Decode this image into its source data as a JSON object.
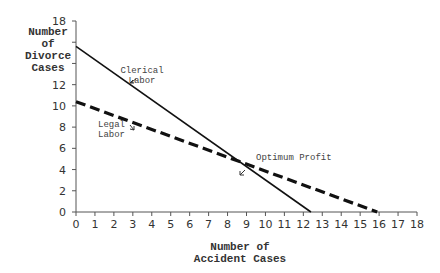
{
  "chart_data": {
    "type": "line",
    "title": "",
    "xlabel": "Number of Accident Cases",
    "ylabel": "Number of Divorce Cases",
    "xlim": [
      0,
      18
    ],
    "ylim": [
      0,
      18
    ],
    "x_ticks": [
      0,
      1,
      2,
      3,
      4,
      5,
      6,
      7,
      8,
      9,
      10,
      11,
      12,
      13,
      14,
      15,
      16,
      17,
      18
    ],
    "y_ticks": [
      0,
      2,
      4,
      6,
      8,
      10,
      12,
      14,
      16,
      18
    ],
    "y_tick_labels_shown": [
      "0",
      "2",
      "4",
      "6",
      "8",
      "10",
      "12",
      "18"
    ],
    "grid": false,
    "series": [
      {
        "name": "Clerical Labor",
        "style": "solid",
        "points": [
          [
            0,
            15.6
          ],
          [
            12.4,
            0
          ]
        ]
      },
      {
        "name": "Legal Labor",
        "style": "dashed",
        "points": [
          [
            0,
            10.4
          ],
          [
            15.9,
            0
          ]
        ]
      }
    ],
    "annotations": [
      {
        "text": "Clerical Labor",
        "points_to": [
          2.7,
          12.2
        ]
      },
      {
        "text": "Legal Labor",
        "points_to": [
          3.1,
          8.4
        ]
      },
      {
        "text": "Optimum Profit",
        "points_to": [
          8.65,
          4.3
        ]
      }
    ]
  },
  "labels": {
    "y_axis": "Number\nof\nDivorce\nCases",
    "x_axis": "Number of\nAccident Cases",
    "clerical": "Clerical\nLabor",
    "legal": "Legal\nLabor",
    "optimum": "Optimum Profit"
  }
}
